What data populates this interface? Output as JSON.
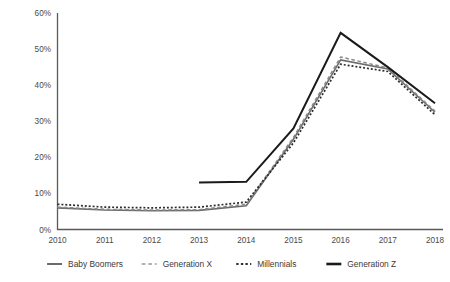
{
  "chart_data": {
    "type": "line",
    "title": "",
    "subtitle": "",
    "xlabel": "",
    "ylabel": "",
    "x": [
      "2010",
      "2011",
      "2012",
      "2013",
      "2014",
      "2015",
      "2016",
      "2017",
      "2018"
    ],
    "xtick_labels": [
      "2010",
      "2011",
      "2012",
      "2013",
      "2014",
      "2015",
      "2016",
      "2017",
      "2018"
    ],
    "ytick_labels": [
      "0%",
      "10%",
      "20%",
      "30%",
      "40%",
      "50%",
      "60%"
    ],
    "ytick_values": [
      0,
      10,
      20,
      30,
      40,
      50,
      60
    ],
    "ylim": [
      0,
      60
    ],
    "xlim": [
      2010,
      2018
    ],
    "grid": false,
    "legend_position": "bottom",
    "value_suffix": "%",
    "series": [
      {
        "name": "Baby Boomers",
        "style": "solid",
        "color": "#6b6b6b",
        "width": 1.6,
        "values": [
          6.0,
          5.4,
          5.2,
          5.3,
          6.6,
          25.0,
          47.0,
          44.5,
          32.5
        ]
      },
      {
        "name": "Generation X",
        "style": "dashed",
        "color": "#8a8a8a",
        "width": 1.5,
        "values": [
          6.2,
          5.6,
          5.4,
          5.5,
          7.0,
          25.5,
          47.8,
          44.8,
          32.8
        ]
      },
      {
        "name": "Millennials",
        "style": "dotted",
        "color": "#2b2b2b",
        "width": 1.7,
        "values": [
          7.0,
          6.2,
          6.0,
          6.2,
          7.6,
          24.0,
          45.8,
          43.8,
          31.8
        ]
      },
      {
        "name": "Generation Z",
        "style": "solid",
        "color": "#1a1a1a",
        "width": 2.0,
        "values": [
          null,
          null,
          null,
          13.0,
          13.2,
          28.0,
          54.5,
          45.0,
          35.0
        ]
      }
    ]
  },
  "legend": {
    "items": [
      {
        "label": "Baby Boomers",
        "style": "solid",
        "color": "#6b6b6b",
        "width": 2.0
      },
      {
        "label": "Generation X",
        "style": "dashed",
        "color": "#9a9a9a",
        "width": 1.6
      },
      {
        "label": "Millennials",
        "style": "dotted",
        "color": "#2b2b2b",
        "width": 2.0
      },
      {
        "label": "Generation Z",
        "style": "solid",
        "color": "#1a1a1a",
        "width": 2.6
      }
    ]
  }
}
